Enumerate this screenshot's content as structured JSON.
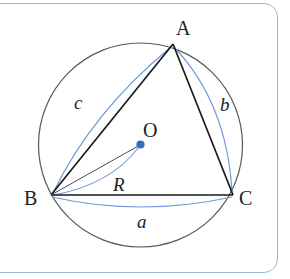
{
  "figure": {
    "type": "geometry-diagram",
    "frame": {
      "border_color": "#9ab6dd",
      "background": "#ffffff",
      "corner_radius": 14
    },
    "colors": {
      "circle_stroke": "#555555",
      "triangle_stroke": "#1a1a1a",
      "arc_blue": "#5b8fd4",
      "center_dot": "#2f6fc4",
      "label_text": "#222222"
    },
    "circle": {
      "label": "circumcircle",
      "center_x": 140.5,
      "center_y": 145,
      "radius": 102
    },
    "center_point": {
      "label": "O",
      "x": 140.5,
      "y": 145
    },
    "vertices": [
      {
        "label": "A",
        "x": 173,
        "y": 44,
        "label_x": 176,
        "label_y": 18
      },
      {
        "label": "B",
        "x": 51,
        "y": 195,
        "label_x": 24,
        "label_y": 188
      },
      {
        "label": "C",
        "x": 233,
        "y": 195,
        "label_x": 239,
        "label_y": 188
      }
    ],
    "sides": [
      {
        "label": "a",
        "from": "B",
        "to": "C",
        "label_x": 137,
        "label_y": 212
      },
      {
        "label": "b",
        "from": "A",
        "to": "C",
        "label_x": 220,
        "label_y": 95
      },
      {
        "label": "c",
        "from": "B",
        "to": "A",
        "label_x": 74,
        "label_y": 93
      }
    ],
    "radius_segment": {
      "label": "R",
      "from": "B",
      "to": "O",
      "label_x": 113,
      "label_y": 175
    },
    "center_label_pos": {
      "x": 143,
      "y": 120
    }
  }
}
